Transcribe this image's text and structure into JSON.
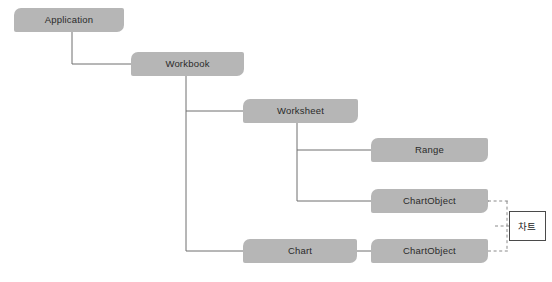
{
  "diagram": {
    "background_color": "#ffffff",
    "node_fill_color": "#b6b6b6",
    "node_text_color": "#2a2a2a",
    "connector_color": "#6e6e6e",
    "dashed_connector_color": "#8a8a8a",
    "callout_border_color": "#4a4a4a",
    "nodes": [
      {
        "id": "application",
        "label": "Application",
        "x": 14,
        "y": 8,
        "w": 110,
        "h": 24
      },
      {
        "id": "workbook",
        "label": "Workbook",
        "x": 131,
        "y": 52,
        "w": 113,
        "h": 24
      },
      {
        "id": "worksheet",
        "label": "Worksheet",
        "x": 243,
        "y": 99,
        "w": 115,
        "h": 24
      },
      {
        "id": "range",
        "label": "Range",
        "x": 371,
        "y": 138,
        "w": 117,
        "h": 24
      },
      {
        "id": "chartobject-1",
        "label": "ChartObject",
        "x": 371,
        "y": 189,
        "w": 117,
        "h": 24
      },
      {
        "id": "chart",
        "label": "Chart",
        "x": 243,
        "y": 239,
        "w": 114,
        "h": 24
      },
      {
        "id": "chartobject-2",
        "label": "ChartObject",
        "x": 371,
        "y": 239,
        "w": 117,
        "h": 24
      }
    ],
    "callout": {
      "id": "chart-callout",
      "label": "차트",
      "x": 509,
      "y": 211,
      "w": 37,
      "h": 30
    },
    "connectors": [
      {
        "from": "application",
        "to": "workbook",
        "style": "solid"
      },
      {
        "from": "workbook",
        "to": "worksheet",
        "style": "solid"
      },
      {
        "from": "workbook",
        "to": "chart",
        "style": "solid"
      },
      {
        "from": "worksheet",
        "to": "range",
        "style": "solid"
      },
      {
        "from": "worksheet",
        "to": "chartobject-1",
        "style": "solid"
      },
      {
        "from": "chart",
        "to": "chartobject-2",
        "style": "solid"
      },
      {
        "from": "chartobject-1",
        "to": "chart-callout",
        "style": "dashed"
      },
      {
        "from": "chartobject-2",
        "to": "chart-callout",
        "style": "dashed"
      }
    ]
  }
}
